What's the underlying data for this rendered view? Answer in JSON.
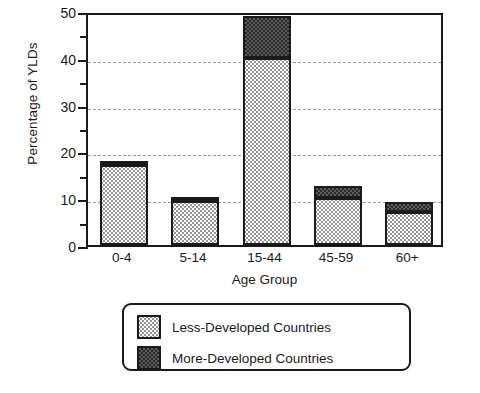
{
  "chart_data": {
    "type": "bar",
    "subtype": "stacked-vertical",
    "title": "",
    "xlabel": "Age Group",
    "ylabel": "Percentage of YLDs",
    "categories": [
      "0-4",
      "5-14",
      "15-44",
      "45-59",
      "60+"
    ],
    "series": [
      {
        "name": "Less-Developed Countries",
        "values": [
          17,
          9.3,
          40,
          10,
          7
        ],
        "fill": "light-dotted",
        "color": "#fdfdfd"
      },
      {
        "name": "More-Developed Countries",
        "values": [
          1,
          1,
          9,
          2.7,
          2.2
        ],
        "fill": "dark-checkered",
        "color": "#5b5b5b"
      }
    ],
    "totals": [
      18,
      10.3,
      49,
      12.7,
      9.2
    ],
    "ylim": [
      0,
      50
    ],
    "ymajor_ticks": [
      0,
      10,
      20,
      30,
      40,
      50
    ],
    "yminor_ticks": [
      5,
      15,
      25,
      35,
      45
    ],
    "ytick_labels": [
      "0",
      "10",
      "20",
      "30",
      "40",
      "50"
    ],
    "grid": "horizontal-dashed-at-major",
    "legend_position": "below-plot"
  },
  "axes": {
    "y_title": "Percentage of YLDs",
    "x_title": "Age Group"
  },
  "legend": {
    "entries": [
      {
        "label": "Less-Developed Countries",
        "swatch": "less-developed-swatch"
      },
      {
        "label": "More-Developed Countries",
        "swatch": "more-developed-swatch"
      }
    ]
  },
  "colors": {
    "axis": "#1a1a1a",
    "grid": "#9a9a9a",
    "less_developed": "#fdfdfd",
    "more_developed": "#5b5b5b",
    "background": "#ffffff"
  }
}
